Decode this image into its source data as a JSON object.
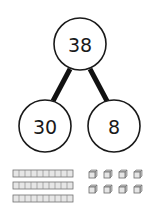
{
  "diagram": {
    "whole": {
      "value": "38"
    },
    "parts": [
      {
        "value": "30"
      },
      {
        "value": "8"
      }
    ],
    "base_ten_blocks": {
      "tens_rods": 3,
      "units_per_rod": 10,
      "unit_cubes": 8
    },
    "colors": {
      "stroke": "#1a1a1a",
      "block_fill": "#e6e6e6",
      "block_edge": "#707070"
    }
  }
}
